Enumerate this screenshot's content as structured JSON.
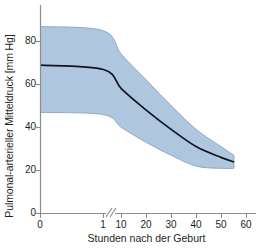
{
  "chart_data": {
    "type": "area",
    "title": "",
    "subtitle": "",
    "xlabel": "Stunden nach der Geburt",
    "ylabel": "Pulmonal-arterieller Mitteldruck [mm Hg]",
    "xlim": [
      0,
      65
    ],
    "ylim": [
      0,
      90
    ],
    "grid": false,
    "legend": "none",
    "axis_break": {
      "between": [
        1,
        10
      ],
      "symbol": "//"
    },
    "xticks": [
      {
        "value": 0,
        "label": "0"
      },
      {
        "value": 1,
        "label": "1"
      },
      {
        "value": 10,
        "label": "10"
      },
      {
        "value": 20,
        "label": "20"
      },
      {
        "value": 30,
        "label": "30"
      },
      {
        "value": 40,
        "label": "40"
      },
      {
        "value": 50,
        "label": "50"
      },
      {
        "value": 60,
        "label": "60"
      }
    ],
    "yticks": [
      {
        "value": 0,
        "label": "0"
      },
      {
        "value": 20,
        "label": "20"
      },
      {
        "value": 40,
        "label": "40"
      },
      {
        "value": 60,
        "label": "60"
      },
      {
        "value": 80,
        "label": "80"
      }
    ],
    "x": [
      0,
      1,
      10,
      20,
      30,
      40,
      50,
      55
    ],
    "series": [
      {
        "name": "Mittelwert",
        "color": "#11131f",
        "values": [
          69,
          67,
          58,
          48,
          39,
          31,
          26,
          24
        ]
      },
      {
        "name": "Obere Begrenzung",
        "color": "#8ca0bd",
        "values": [
          87,
          85,
          74,
          62,
          50,
          39,
          31,
          27
        ]
      },
      {
        "name": "Untere Begrenzung",
        "color": "#8ca0bd",
        "values": [
          47,
          46,
          40,
          33,
          27,
          22,
          21,
          21
        ]
      }
    ],
    "band_fill": "#aec6de",
    "band_stroke": "#8ca0bd",
    "axis_color": "#8c8c8c",
    "text_color": "#231f20",
    "background": "#ffffff"
  }
}
